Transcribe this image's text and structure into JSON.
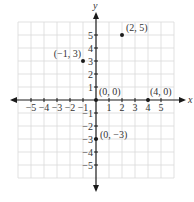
{
  "chart_data": {
    "type": "scatter",
    "title": "",
    "xlabel": "x",
    "ylabel": "y",
    "xlim": [
      -6,
      6
    ],
    "ylim": [
      -6,
      6
    ],
    "grid": true,
    "x_ticks": [
      -5,
      -4,
      -3,
      -2,
      -1,
      1,
      2,
      3,
      4,
      5
    ],
    "y_ticks": [
      5,
      4,
      3,
      2,
      1,
      -1,
      -2,
      -3,
      -4,
      -5
    ],
    "x_tick_labels": [
      "−5",
      "−4",
      "−3",
      "−2",
      "−1",
      "1",
      "2",
      "3",
      "4",
      "5"
    ],
    "y_tick_labels": [
      "5",
      "4",
      "3",
      "2",
      "1",
      "−1",
      "−2",
      "−3",
      "−4",
      "−5"
    ],
    "points": [
      {
        "x": 2,
        "y": 5,
        "label": "(2, 5)"
      },
      {
        "x": -1,
        "y": 3,
        "label": "(−1, 3)"
      },
      {
        "x": 0,
        "y": 0,
        "label": "(0, 0)"
      },
      {
        "x": 4,
        "y": 0,
        "label": "(4, 0)"
      },
      {
        "x": 0,
        "y": -3,
        "label": "(0, −3)"
      }
    ]
  },
  "colors": {
    "grid": "#d9d9d9",
    "axis": "#1a1a1a",
    "point": "#1a1a1a",
    "text": "#333333"
  }
}
